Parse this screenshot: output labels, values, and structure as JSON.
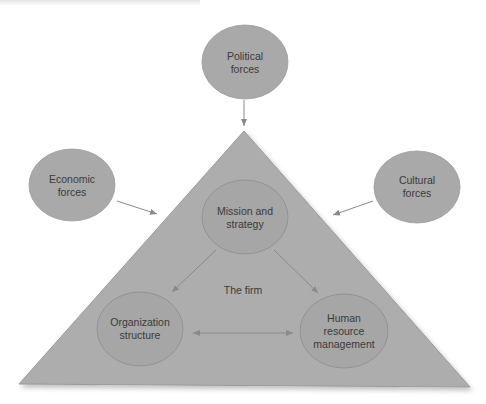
{
  "diagram": {
    "colors": {
      "fill": "#a9a9a9",
      "triangle_fill": "#adadad",
      "stroke": "#8d8d8d",
      "arrow": "#8a8a8a",
      "text": "#3a3a3a"
    },
    "external_forces": [
      {
        "id": "political",
        "label": "Political\nforces"
      },
      {
        "id": "economic",
        "label": "Economic\nforces"
      },
      {
        "id": "cultural",
        "label": "Cultural\nforces"
      }
    ],
    "firm": {
      "label": "The firm",
      "components": [
        {
          "id": "mission",
          "label": "Mission and\nstrategy"
        },
        {
          "id": "organization",
          "label": "Organization\nstructure"
        },
        {
          "id": "hrm",
          "label": "Human\nresource\nmanagement"
        }
      ]
    },
    "edges": [
      {
        "from": "Political forces",
        "to": "The firm"
      },
      {
        "from": "Economic forces",
        "to": "The firm"
      },
      {
        "from": "Cultural forces",
        "to": "The firm"
      },
      {
        "from": "Mission and strategy",
        "to": "Organization structure"
      },
      {
        "from": "Mission and strategy",
        "to": "Human resource management"
      },
      {
        "from": "Organization structure",
        "to": "Human resource management",
        "bidirectional": true
      }
    ]
  }
}
